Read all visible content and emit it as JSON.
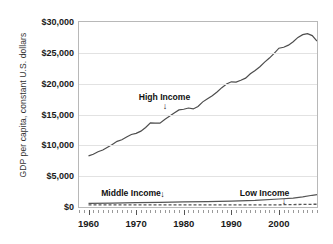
{
  "chart_data": {
    "type": "line",
    "title": "",
    "xlabel": "",
    "ylabel": "GDP per capita, constant U.S. dollars",
    "xlim": [
      1958,
      2008
    ],
    "ylim": [
      0,
      30000
    ],
    "grid": true,
    "legend_position": "inline-annotations",
    "y_ticks": [
      "$0",
      "$5,000",
      "$10,000",
      "$15,000",
      "$20,000",
      "$25,000",
      "$30,000"
    ],
    "y_tick_values": [
      0,
      5000,
      10000,
      15000,
      20000,
      25000,
      30000
    ],
    "x_ticks": [
      "1960",
      "1970",
      "1980",
      "1990",
      "2000"
    ],
    "x_tick_values": [
      1960,
      1970,
      1980,
      1990,
      2000
    ],
    "annotations": [
      {
        "text": "High Income",
        "x": 1976,
        "y": 18600,
        "arrow": "down"
      },
      {
        "text": "Middle Income",
        "x": 1974,
        "y": 3100,
        "arrow": "down"
      },
      {
        "text": "Low Income",
        "x": 2001,
        "y": 3100,
        "arrow": "down"
      }
    ],
    "series": [
      {
        "name": "High Income",
        "style": "solid",
        "color": "#4d4d4d",
        "x": [
          1960,
          1961,
          1962,
          1963,
          1964,
          1965,
          1966,
          1967,
          1968,
          1969,
          1970,
          1971,
          1972,
          1973,
          1974,
          1975,
          1976,
          1977,
          1978,
          1979,
          1980,
          1981,
          1982,
          1983,
          1984,
          1985,
          1986,
          1987,
          1988,
          1989,
          1990,
          1991,
          1992,
          1993,
          1994,
          1995,
          1996,
          1997,
          1998,
          1999,
          2000,
          2001,
          2002,
          2003,
          2004,
          2005,
          2006,
          2007,
          2008
        ],
        "values": [
          8300,
          8550,
          8950,
          9250,
          9700,
          10150,
          10650,
          10900,
          11350,
          11750,
          11950,
          12300,
          12900,
          13650,
          13600,
          13600,
          14200,
          14700,
          15250,
          15750,
          15850,
          16050,
          15900,
          16300,
          17050,
          17550,
          18050,
          18650,
          19350,
          19950,
          20300,
          20250,
          20550,
          20900,
          21600,
          22150,
          22750,
          23500,
          24150,
          24900,
          25750,
          25900,
          26250,
          26800,
          27500,
          27950,
          28100,
          27800,
          26900
        ]
      },
      {
        "name": "Middle Income",
        "style": "solid",
        "color": "#555555",
        "x": [
          1960,
          1965,
          1970,
          1975,
          1980,
          1985,
          1990,
          1995,
          2000,
          2003,
          2005,
          2007,
          2008
        ],
        "values": [
          600,
          640,
          700,
          760,
          830,
          880,
          960,
          1080,
          1300,
          1450,
          1650,
          1900,
          2000
        ]
      },
      {
        "name": "Low Income",
        "style": "dashed",
        "color": "#555555",
        "x": [
          1960,
          1970,
          1980,
          1990,
          2000,
          2008
        ],
        "values": [
          330,
          340,
          345,
          330,
          360,
          450
        ]
      }
    ]
  }
}
